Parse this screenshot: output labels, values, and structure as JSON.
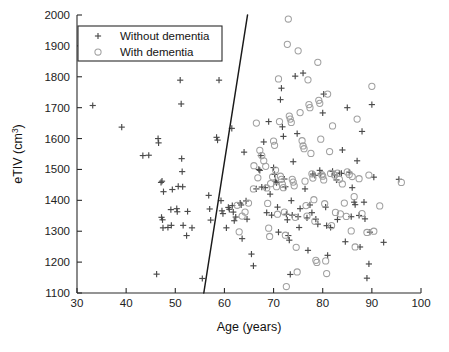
{
  "figure": {
    "background_color": "#ffffff",
    "plot_area": {
      "left": 77,
      "top": 15,
      "right": 421,
      "bottom": 293
    }
  },
  "chart_data": {
    "type": "scatter",
    "title": "",
    "xlabel": "Age (years)",
    "ylabel": "eTIV (cm3)",
    "ylabel_display": "eTIV (cm",
    "ylabel_superscript": "3",
    "ylabel_suffix": ")",
    "xlim": [
      30,
      100
    ],
    "ylim": [
      1100,
      2000
    ],
    "xticks": [
      30,
      40,
      50,
      60,
      70,
      80,
      90,
      100
    ],
    "yticks": [
      1100,
      1200,
      1300,
      1400,
      1500,
      1600,
      1700,
      1800,
      1900,
      2000
    ],
    "xtick_labels": [
      "30",
      "40",
      "50",
      "60",
      "70",
      "80",
      "90",
      "100"
    ],
    "ytick_labels": [
      "1100",
      "1200",
      "1300",
      "1400",
      "1500",
      "1600",
      "1700",
      "1800",
      "1900",
      "2000"
    ],
    "grid": false,
    "legend_position": "upper-left",
    "annotations": [
      {
        "name": "decision-boundary",
        "type": "line",
        "x0": 55.8,
        "y0": 1100,
        "x1": 64.7,
        "y1": 2000,
        "color": "#1a1a1a"
      }
    ],
    "series": [
      {
        "name": "Without dementia",
        "marker": "plus",
        "color": "#4a4a4a",
        "points": [
          [
            33.2,
            1707
          ],
          [
            39.1,
            1637
          ],
          [
            43.4,
            1545
          ],
          [
            44.6,
            1546
          ],
          [
            46.2,
            1161
          ],
          [
            46.5,
            1600
          ],
          [
            46.6,
            1586
          ],
          [
            47.1,
            1458
          ],
          [
            47.3,
            1462
          ],
          [
            47.2,
            1345
          ],
          [
            47.4,
            1337
          ],
          [
            47.5,
            1311
          ],
          [
            47.6,
            1428
          ],
          [
            48.5,
            1312
          ],
          [
            49.1,
            1370
          ],
          [
            49.2,
            1319
          ],
          [
            49.4,
            1435
          ],
          [
            50.3,
            1373
          ],
          [
            50.4,
            1363
          ],
          [
            50.6,
            1445
          ],
          [
            51.0,
            1789
          ],
          [
            51.2,
            1712
          ],
          [
            51.3,
            1535
          ],
          [
            51.4,
            1493
          ],
          [
            51.5,
            1444
          ],
          [
            51.6,
            1319
          ],
          [
            52.3,
            1286
          ],
          [
            52.5,
            1364
          ],
          [
            53.4,
            1311
          ],
          [
            55.5,
            1147
          ],
          [
            56.8,
            1416
          ],
          [
            57.0,
            1372
          ],
          [
            57.2,
            1336
          ],
          [
            58.4,
            1604
          ],
          [
            58.6,
            1595
          ],
          [
            58.9,
            1789
          ],
          [
            59.3,
            1399
          ],
          [
            59.5,
            1366
          ],
          [
            59.7,
            1357
          ],
          [
            60.4,
            1311
          ],
          [
            60.8,
            1377
          ],
          [
            61.0,
            1371
          ],
          [
            61.5,
            1633
          ],
          [
            61.6,
            1383
          ],
          [
            61.8,
            1362
          ],
          [
            62.0,
            1334
          ],
          [
            62.3,
            1346
          ],
          [
            63.2,
            1391
          ],
          [
            63.4,
            1385
          ],
          [
            63.6,
            1276
          ],
          [
            64.0,
            1556
          ],
          [
            64.4,
            1398
          ],
          [
            64.6,
            1339
          ],
          [
            65.5,
            1226
          ],
          [
            65.9,
            1188
          ],
          [
            66.5,
            1437
          ],
          [
            67.0,
            1500
          ],
          [
            67.2,
            1497
          ],
          [
            67.4,
            1545
          ],
          [
            67.6,
            1443
          ],
          [
            68.0,
            1589
          ],
          [
            68.3,
            1441
          ],
          [
            68.6,
            1360
          ],
          [
            69.0,
            1655
          ],
          [
            69.3,
            1420
          ],
          [
            69.6,
            1352
          ],
          [
            70.0,
            1506
          ],
          [
            70.2,
            1484
          ],
          [
            70.4,
            1462
          ],
          [
            70.6,
            1457
          ],
          [
            70.8,
            1378
          ],
          [
            71.0,
            1297
          ],
          [
            71.4,
            1726
          ],
          [
            71.6,
            1763
          ],
          [
            71.8,
            1638
          ],
          [
            72.0,
            1607
          ],
          [
            72.2,
            1469
          ],
          [
            72.4,
            1444
          ],
          [
            72.6,
            1355
          ],
          [
            72.8,
            1337
          ],
          [
            73.0,
            1286
          ],
          [
            73.2,
            1271
          ],
          [
            73.4,
            1160
          ],
          [
            73.6,
            1399
          ],
          [
            73.8,
            1352
          ],
          [
            74.0,
            1525
          ],
          [
            74.4,
            1802
          ],
          [
            74.8,
            1616
          ],
          [
            75.0,
            1347
          ],
          [
            75.2,
            1312
          ],
          [
            75.4,
            1373
          ],
          [
            76.0,
            1812
          ],
          [
            76.4,
            1437
          ],
          [
            76.8,
            1343
          ],
          [
            77.0,
            1238
          ],
          [
            77.4,
            1385
          ],
          [
            77.8,
            1360
          ],
          [
            78.0,
            1485
          ],
          [
            78.4,
            1481
          ],
          [
            78.6,
            1339
          ],
          [
            79.0,
            1323
          ],
          [
            79.4,
            1497
          ],
          [
            79.6,
            1486
          ],
          [
            80.0,
            1683
          ],
          [
            80.2,
            1744
          ],
          [
            80.6,
            1378
          ],
          [
            80.8,
            1318
          ],
          [
            81.0,
            1222
          ],
          [
            81.6,
            1312
          ],
          [
            82.0,
            1494
          ],
          [
            82.4,
            1482
          ],
          [
            82.8,
            1466
          ],
          [
            83.0,
            1338
          ],
          [
            83.4,
            1488
          ],
          [
            83.8,
            1487
          ],
          [
            84.0,
            1563
          ],
          [
            84.6,
            1266
          ],
          [
            85.0,
            1700
          ],
          [
            85.4,
            1491
          ],
          [
            85.8,
            1347
          ],
          [
            86.0,
            1441
          ],
          [
            86.4,
            1394
          ],
          [
            86.6,
            1386
          ],
          [
            87.0,
            1528
          ],
          [
            87.4,
            1351
          ],
          [
            87.6,
            1249
          ],
          [
            88.0,
            1623
          ],
          [
            88.4,
            1394
          ],
          [
            88.6,
            1340
          ],
          [
            89.0,
            1148
          ],
          [
            89.4,
            1194
          ],
          [
            89.6,
            1297
          ],
          [
            90.0,
            1710
          ],
          [
            90.4,
            1475
          ],
          [
            92.4,
            1264
          ],
          [
            95.5,
            1468
          ]
        ]
      },
      {
        "name": "With dementia",
        "marker": "circle",
        "color": "#a0a0a0",
        "points": [
          [
            66.5,
            1650
          ],
          [
            67.2,
            1562
          ],
          [
            67.6,
            1545
          ],
          [
            68.0,
            1528
          ],
          [
            68.4,
            1510
          ],
          [
            68.6,
            1440
          ],
          [
            68.8,
            1390
          ],
          [
            69.0,
            1310
          ],
          [
            69.2,
            1283
          ],
          [
            69.4,
            1454
          ],
          [
            69.8,
            1476
          ],
          [
            70.0,
            1592
          ],
          [
            70.2,
            1578
          ],
          [
            70.4,
            1498
          ],
          [
            70.6,
            1444
          ],
          [
            70.8,
            1355
          ],
          [
            71.0,
            1793
          ],
          [
            71.2,
            1655
          ],
          [
            71.4,
            1478
          ],
          [
            71.6,
            1468
          ],
          [
            71.8,
            1452
          ],
          [
            72.0,
            1441
          ],
          [
            72.2,
            1362
          ],
          [
            72.4,
            1287
          ],
          [
            72.6,
            1121
          ],
          [
            72.8,
            1905
          ],
          [
            73.0,
            1987
          ],
          [
            73.2,
            1673
          ],
          [
            73.4,
            1663
          ],
          [
            73.6,
            1652
          ],
          [
            73.8,
            1468
          ],
          [
            74.0,
            1459
          ],
          [
            74.2,
            1447
          ],
          [
            74.4,
            1345
          ],
          [
            74.6,
            1248
          ],
          [
            74.8,
            1168
          ],
          [
            75.0,
            1884
          ],
          [
            75.4,
            1684
          ],
          [
            75.8,
            1593
          ],
          [
            76.0,
            1576
          ],
          [
            76.2,
            1567
          ],
          [
            76.4,
            1462
          ],
          [
            76.6,
            1383
          ],
          [
            76.8,
            1349
          ],
          [
            77.0,
            1790
          ],
          [
            77.2,
            1710
          ],
          [
            77.4,
            1700
          ],
          [
            77.6,
            1552
          ],
          [
            77.8,
            1486
          ],
          [
            78.0,
            1472
          ],
          [
            78.2,
            1402
          ],
          [
            78.4,
            1332
          ],
          [
            78.6,
            1206
          ],
          [
            78.8,
            1199
          ],
          [
            79.0,
            1847
          ],
          [
            79.2,
            1724
          ],
          [
            79.4,
            1714
          ],
          [
            79.6,
            1598
          ],
          [
            79.8,
            1483
          ],
          [
            80.0,
            1478
          ],
          [
            80.2,
            1466
          ],
          [
            80.4,
            1389
          ],
          [
            80.6,
            1204
          ],
          [
            80.8,
            1163
          ],
          [
            81.0,
            1744
          ],
          [
            81.4,
            1558
          ],
          [
            81.6,
            1487
          ],
          [
            81.8,
            1318
          ],
          [
            82.0,
            1641
          ],
          [
            82.4,
            1482
          ],
          [
            82.6,
            1361
          ],
          [
            83.0,
            1488
          ],
          [
            83.4,
            1468
          ],
          [
            83.6,
            1356
          ],
          [
            84.0,
            1453
          ],
          [
            84.4,
            1391
          ],
          [
            84.8,
            1348
          ],
          [
            85.0,
            1492
          ],
          [
            85.4,
            1484
          ],
          [
            85.8,
            1301
          ],
          [
            86.0,
            1477
          ],
          [
            86.4,
            1412
          ],
          [
            86.6,
            1249
          ],
          [
            87.0,
            1663
          ],
          [
            87.4,
            1470
          ],
          [
            88.0,
            1357
          ],
          [
            89.0,
            1296
          ],
          [
            89.4,
            1482
          ],
          [
            90.0,
            1769
          ],
          [
            90.4,
            1300
          ],
          [
            91.6,
            1382
          ],
          [
            96.0,
            1458
          ],
          [
            65.9,
            1437
          ],
          [
            64.9,
            1391
          ],
          [
            64.2,
            1362
          ],
          [
            63.6,
            1349
          ],
          [
            63.0,
            1298
          ],
          [
            62.6,
            1384
          ],
          [
            66.0,
            1512
          ],
          [
            66.8,
            1473
          ]
        ]
      }
    ]
  },
  "legend": {
    "entries": [
      {
        "label": "Without dementia",
        "marker": "plus",
        "color": "#4a4a4a"
      },
      {
        "label": "With dementia",
        "marker": "circle",
        "color": "#a0a0a0"
      }
    ]
  }
}
